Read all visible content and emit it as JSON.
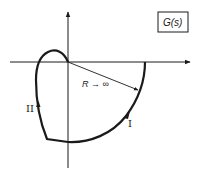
{
  "diagram": {
    "title_box": {
      "label": "G(s)"
    },
    "radius_label": "R → ∞",
    "curve_labels": {
      "segment_1": "I",
      "segment_2": "II"
    },
    "axes": {
      "horizontal": "real-axis",
      "vertical": "imaginary-axis"
    },
    "colors": {
      "stroke": "#1a1a1a",
      "background": "#ffffff"
    }
  }
}
